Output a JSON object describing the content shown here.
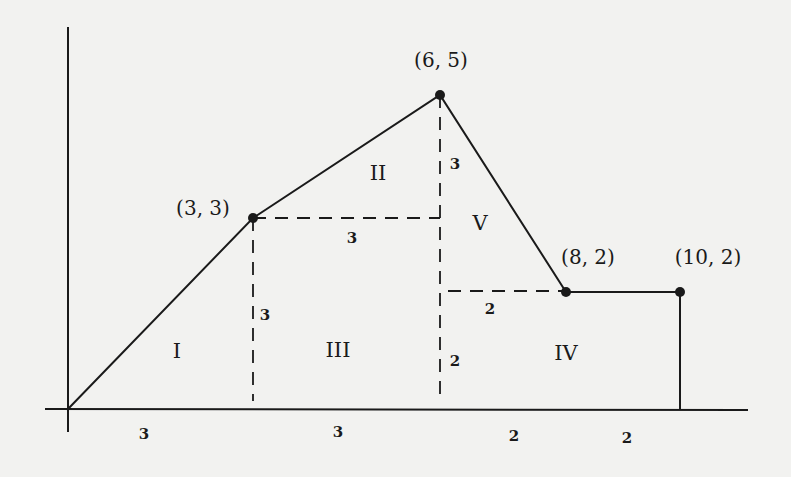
{
  "diagram": {
    "type": "piecewise-linear graph area decomposition",
    "colors": {
      "background": "#f2f2f0",
      "stroke": "#1a1a1a"
    },
    "points": [
      {
        "label": "(3, 3)",
        "x": 3,
        "y": 3
      },
      {
        "label": "(6, 5)",
        "x": 6,
        "y": 5
      },
      {
        "label": "(8, 2)",
        "x": 8,
        "y": 2
      },
      {
        "label": "(10, 2)",
        "x": 10,
        "y": 2
      }
    ],
    "regions": [
      {
        "label": "I"
      },
      {
        "label": "II"
      },
      {
        "label": "III"
      },
      {
        "label": "IV"
      },
      {
        "label": "V"
      }
    ],
    "dimensions": {
      "x_axis": [
        "3",
        "3",
        "2",
        "2"
      ],
      "dash_3_3_horizontal": "3",
      "dash_x3_vertical": "3",
      "dash_x6_upper_vertical": "3",
      "dash_x6_lower_vertical": "2",
      "dash_y2_horizontal": "2"
    }
  }
}
